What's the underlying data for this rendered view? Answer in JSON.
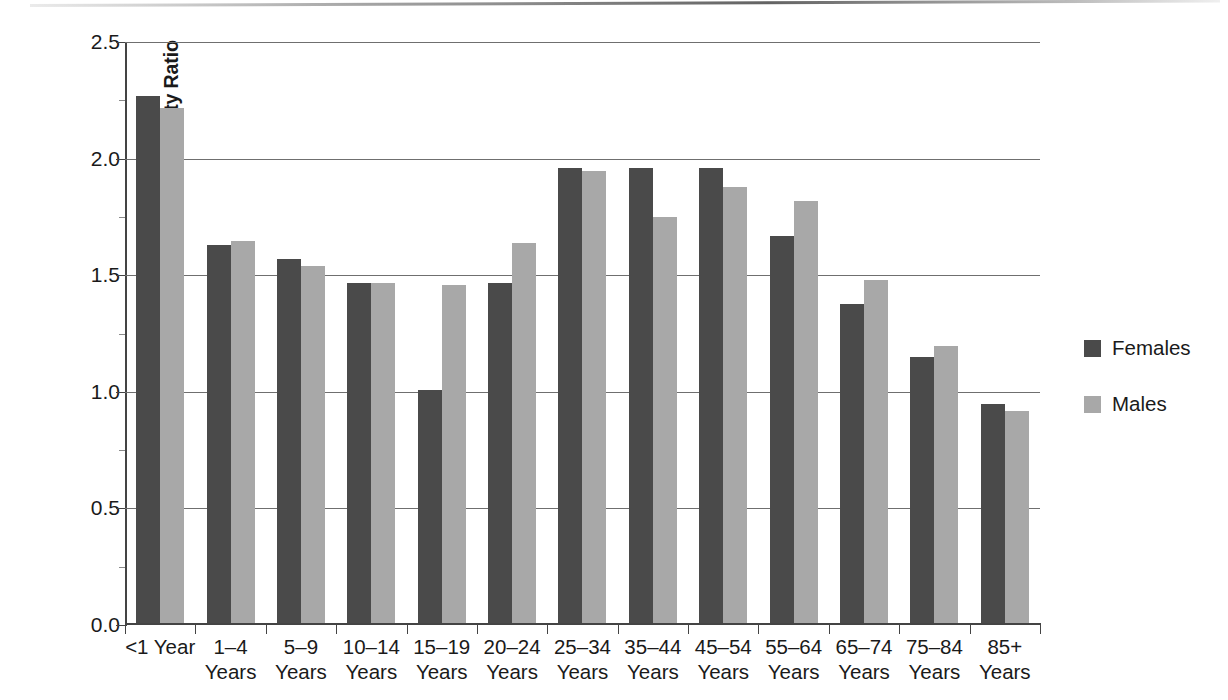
{
  "chart_data": {
    "type": "bar",
    "title": "",
    "xlabel": "",
    "ylabel": "Black:White Mortality Ratio",
    "ylim": [
      0.0,
      2.5
    ],
    "ytick_labels": [
      "2.5",
      "2.0",
      "1.5",
      "1.0",
      "0.5",
      "0.0"
    ],
    "ytick_values": [
      2.5,
      2.0,
      1.5,
      1.0,
      0.5,
      0.0
    ],
    "grid": true,
    "legend_position": "right",
    "categories": [
      "<1 Year",
      "1–4 Years",
      "5–9 Years",
      "10–14 Years",
      "15–19 Years",
      "20–24 Years",
      "25–34 Years",
      "35–44 Years",
      "45–54 Years",
      "55–64 Years",
      "65–74 Years",
      "75–84 Years",
      "85+ Years"
    ],
    "category_lines": [
      [
        "<1 Year",
        ""
      ],
      [
        "1–4",
        "Years"
      ],
      [
        "5–9",
        "Years"
      ],
      [
        "10–14",
        "Years"
      ],
      [
        "15–19",
        "Years"
      ],
      [
        "20–24",
        "Years"
      ],
      [
        "25–34",
        "Years"
      ],
      [
        "35–44",
        "Years"
      ],
      [
        "45–54",
        "Years"
      ],
      [
        "55–64",
        "Years"
      ],
      [
        "65–74",
        "Years"
      ],
      [
        "75–84",
        "Years"
      ],
      [
        "85+",
        "Years"
      ]
    ],
    "series": [
      {
        "name": "Females",
        "color": "#4a4a4a",
        "values": [
          2.26,
          1.62,
          1.56,
          1.46,
          1.0,
          1.46,
          1.95,
          1.95,
          1.95,
          1.66,
          1.37,
          1.14,
          0.94
        ]
      },
      {
        "name": "Males",
        "color": "#a8a8a8",
        "values": [
          2.21,
          1.64,
          1.53,
          1.46,
          1.45,
          1.63,
          1.94,
          1.74,
          1.87,
          1.81,
          1.47,
          1.19,
          0.91
        ]
      }
    ]
  },
  "legend": {
    "entries": [
      {
        "label": "Females",
        "color": "#4a4a4a"
      },
      {
        "label": "Males",
        "color": "#a8a8a8"
      }
    ]
  },
  "axis": {
    "y_title": "Black:White Mortality Ratio"
  }
}
